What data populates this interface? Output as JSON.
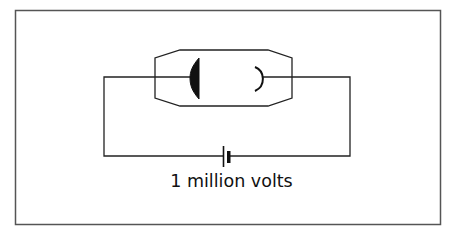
{
  "diagram": {
    "title": "",
    "battery_label": "1 million volts",
    "components": [
      {
        "id": "vacuum-tube",
        "type": "tube",
        "elements": [
          "cathode",
          "anode"
        ]
      },
      {
        "id": "battery",
        "type": "battery",
        "label": "1 million volts"
      }
    ],
    "colors": {
      "frame": "#555555",
      "line": "#222222",
      "fill": "#111111",
      "background": "#ffffff"
    }
  }
}
